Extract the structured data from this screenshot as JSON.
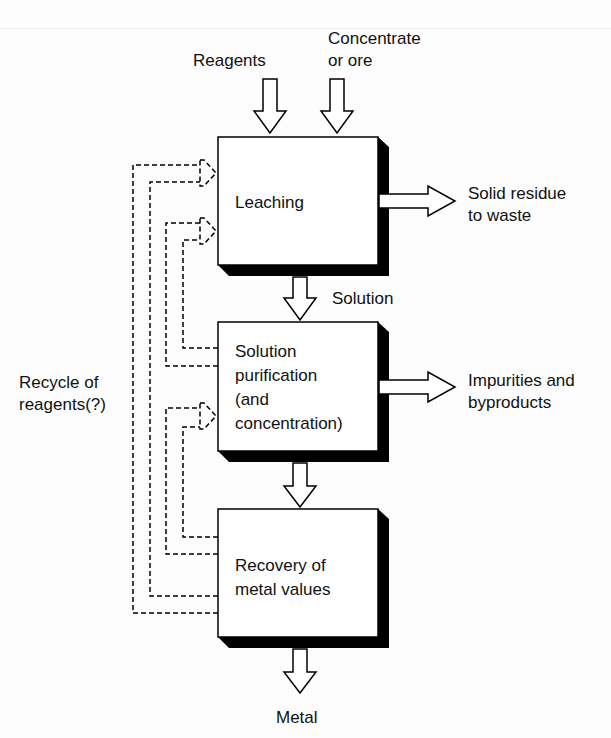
{
  "diagram": {
    "title": "",
    "inputs": {
      "reagents": "Reagents",
      "concentrate_line1": "Concentrate",
      "concentrate_line2": "or ore"
    },
    "stages": [
      {
        "id": "leaching",
        "lines": [
          "Leaching"
        ]
      },
      {
        "id": "purification",
        "lines": [
          "Solution",
          "purification",
          "(and",
          "concentration)"
        ]
      },
      {
        "id": "recovery",
        "lines": [
          "Recovery of",
          "metal values"
        ]
      }
    ],
    "flows": {
      "solution": "Solution",
      "metal": "Metal"
    },
    "outputs": {
      "solid_residue_line1": "Solid residue",
      "solid_residue_line2": "to waste",
      "impurities_line1": "Impurities and",
      "impurities_line2": "byproducts"
    },
    "recycle": {
      "line1": "Recycle of",
      "line2": "reagents(?)"
    }
  }
}
